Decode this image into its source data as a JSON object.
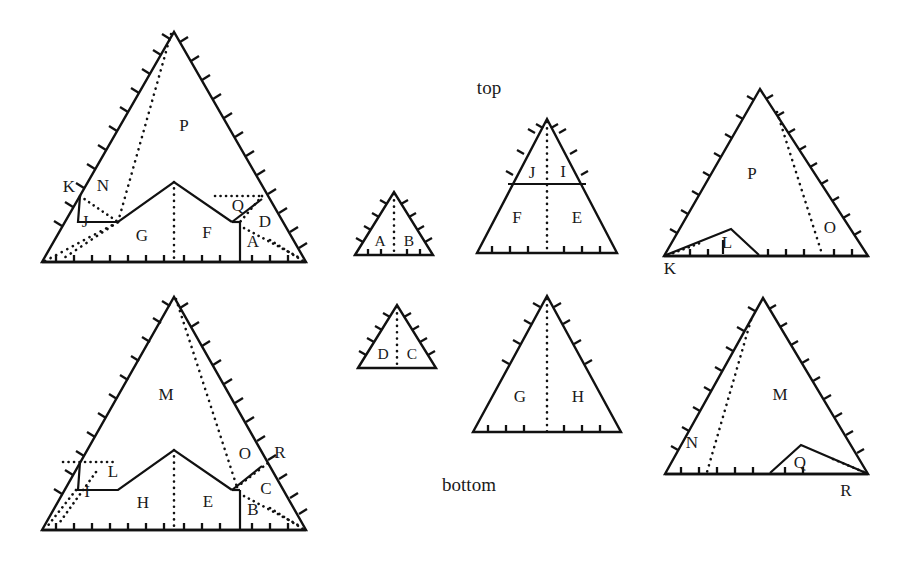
{
  "figure": {
    "title": "",
    "background": "#ffffff",
    "ink": "#111111",
    "captions": {
      "top": "top",
      "bottom": "bottom"
    },
    "panels": [
      {
        "id": "top-left",
        "role": "large-folded-top-view",
        "region_labels": [
          "P",
          "K",
          "N",
          "J",
          "G",
          "F",
          "Q",
          "D",
          "A"
        ]
      },
      {
        "id": "bottom-left",
        "role": "large-folded-bottom-view",
        "region_labels": [
          "M",
          "L",
          "I",
          "H",
          "E",
          "O",
          "R",
          "C",
          "B"
        ]
      },
      {
        "id": "mid-upper-small",
        "role": "small-triangle-top",
        "region_labels": [
          "A",
          "B"
        ]
      },
      {
        "id": "mid-lower-small",
        "role": "small-triangle-bottom",
        "region_labels": [
          "D",
          "C"
        ]
      },
      {
        "id": "mid-upper-medium",
        "role": "medium-triangle-top",
        "region_labels": [
          "J",
          "I",
          "F",
          "E"
        ]
      },
      {
        "id": "mid-lower-medium",
        "role": "medium-triangle-bottom",
        "region_labels": [
          "G",
          "H"
        ]
      },
      {
        "id": "top-right",
        "role": "unfolded-top-view",
        "region_labels": [
          "P",
          "L",
          "K",
          "O"
        ]
      },
      {
        "id": "bottom-right",
        "role": "unfolded-bottom-view",
        "region_labels": [
          "M",
          "N",
          "Q",
          "R"
        ]
      }
    ],
    "labels": {
      "A": "A",
      "B": "B",
      "C": "C",
      "D": "D",
      "E": "E",
      "F": "F",
      "G": "G",
      "H": "H",
      "I": "I",
      "J": "J",
      "K": "K",
      "L": "L",
      "M": "M",
      "N": "N",
      "O": "O",
      "P": "P",
      "Q": "Q",
      "R": "R"
    }
  }
}
